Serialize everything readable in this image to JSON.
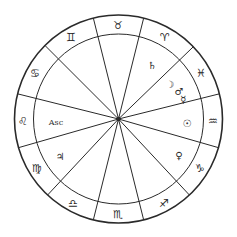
{
  "chart": {
    "center": [
      118.5,
      119
    ],
    "outer_radius": 104,
    "inner_radius": 85,
    "colors": {
      "line": "#2a2a2a",
      "background": "#ffffff"
    },
    "cusp_angles_deg": [
      14,
      44,
      76,
      104,
      135,
      166,
      196,
      227,
      256,
      284,
      313,
      344
    ],
    "signs": [
      {
        "name": "pisces-sign",
        "glyph": "♓",
        "x": 201,
        "y": 73
      },
      {
        "name": "aries-sign",
        "glyph": "♈",
        "x": 165,
        "y": 37
      },
      {
        "name": "taurus-sign",
        "glyph": "♉",
        "x": 118,
        "y": 25
      },
      {
        "name": "gemini-sign",
        "glyph": "♊",
        "x": 71,
        "y": 37
      },
      {
        "name": "cancer-sign",
        "glyph": "♋",
        "x": 35,
        "y": 73
      },
      {
        "name": "leo-sign",
        "glyph": "♌",
        "x": 23,
        "y": 121
      },
      {
        "name": "virgo-sign",
        "glyph": "♍",
        "x": 37,
        "y": 168
      },
      {
        "name": "libra-sign",
        "glyph": "♎",
        "x": 73,
        "y": 203
      },
      {
        "name": "scorpio-sign",
        "glyph": "♏",
        "x": 118,
        "y": 214
      },
      {
        "name": "sagittarius-sign",
        "glyph": "♐",
        "x": 164,
        "y": 203
      },
      {
        "name": "capricorn-sign",
        "glyph": "♑",
        "x": 200,
        "y": 168
      },
      {
        "name": "aquarius-sign",
        "glyph": "♒",
        "x": 213,
        "y": 121
      }
    ],
    "planets": [
      {
        "name": "saturn-glyph",
        "glyph": "♄",
        "x": 152,
        "y": 65
      },
      {
        "name": "moon-glyph",
        "glyph": "☽",
        "x": 170,
        "y": 84
      },
      {
        "name": "mars-glyph",
        "glyph": "♂",
        "x": 179,
        "y": 91
      },
      {
        "name": "mercury-glyph",
        "glyph": "☿",
        "x": 183,
        "y": 99
      },
      {
        "name": "sun-glyph",
        "glyph": "☉",
        "x": 187,
        "y": 123
      },
      {
        "name": "venus-glyph",
        "glyph": "♀",
        "x": 179,
        "y": 155
      },
      {
        "name": "jupiter-glyph",
        "glyph": "♃",
        "x": 60,
        "y": 156
      }
    ],
    "ascendant": {
      "label": "Asc",
      "x": 56,
      "y": 122
    }
  }
}
